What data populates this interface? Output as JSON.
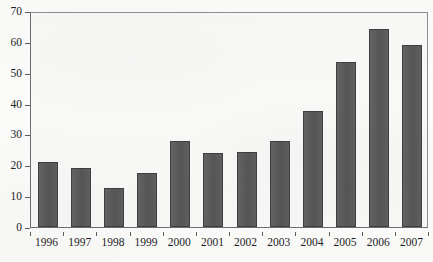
{
  "chart_data": {
    "type": "bar",
    "title": "",
    "subtitle": "",
    "xlabel": "",
    "ylabel": "",
    "categories": [
      "1996",
      "1997",
      "1998",
      "1999",
      "2000",
      "2001",
      "2002",
      "2003",
      "2004",
      "2005",
      "2006",
      "2007"
    ],
    "values": [
      21,
      19,
      12.5,
      17.5,
      27.8,
      24,
      24.2,
      28,
      37.5,
      53.5,
      64.3,
      59
    ],
    "series": [
      {
        "name": "",
        "values": [
          21,
          19,
          12.5,
          17.5,
          27.8,
          24,
          24.2,
          28,
          37.5,
          53.5,
          64.3,
          59
        ]
      }
    ],
    "ylim": [
      0,
      70
    ],
    "y_ticks": [
      0,
      10,
      20,
      30,
      40,
      50,
      60,
      70
    ],
    "y_tick_labels": [
      "0",
      "10",
      "20",
      "30",
      "40",
      "50",
      "60",
      "70"
    ],
    "x_tick_labels": [
      "1996",
      "1997",
      "1998",
      "1999",
      "2000",
      "2001",
      "2002",
      "2003",
      "2004",
      "2005",
      "2006",
      "2007"
    ],
    "grid": false,
    "legend": null,
    "legend_position": "none",
    "annotations": [],
    "colors": {
      "bar_fill": "#5a5a5a",
      "bar_edge": "#3f3f3f",
      "axis": "#6e6e6e",
      "plot_background": "#f8f8f7",
      "figure_background": "#fbfbfa",
      "text": "#1d1d1d"
    }
  }
}
